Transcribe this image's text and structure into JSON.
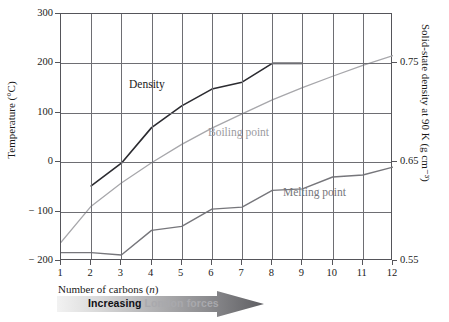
{
  "chart_data": {
    "type": "line",
    "title": "",
    "xlabel": "Number of carbons (n)",
    "ylabel": "Temperature (°C)",
    "y2label": "Solid-state density at 90 K (g cm⁻³)",
    "x": [
      1,
      2,
      3,
      4,
      5,
      6,
      7,
      8,
      9,
      10,
      11,
      12
    ],
    "xlim": [
      1,
      12
    ],
    "ylim": [
      -200,
      300
    ],
    "y2lim": [
      0.55,
      0.8
    ],
    "yticks": [
      -200,
      -100,
      0,
      100,
      200,
      300
    ],
    "ytick_labels": [
      "− 200",
      "− 100",
      "0",
      "100",
      "200",
      "300"
    ],
    "y2ticks": [
      0.55,
      0.65,
      0.75
    ],
    "y2tick_labels": [
      "0.55",
      "0.65",
      "0.75"
    ],
    "xticks": [
      1,
      2,
      3,
      4,
      5,
      6,
      7,
      8,
      9,
      10,
      11,
      12
    ],
    "xtick_labels": [
      "1",
      "2",
      "3",
      "4",
      "5",
      "6",
      "7",
      "8",
      "9",
      "10",
      "11",
      "12"
    ],
    "grid": true,
    "legend": "inline-labels",
    "series": [
      {
        "name": "Density",
        "axis": "right",
        "color": "#2b2b30",
        "x": [
          2,
          3,
          4,
          5,
          6,
          7,
          8,
          9
        ],
        "values": [
          0.626,
          0.649,
          0.685,
          0.707,
          0.724,
          0.731,
          0.75,
          0.75
        ]
      },
      {
        "name": "Boiling point",
        "axis": "left",
        "color": "#a7a7ab",
        "x": [
          1,
          2,
          3,
          4,
          5,
          6,
          7,
          8,
          9,
          10,
          11,
          12
        ],
        "values": [
          -162,
          -89,
          -42,
          -1,
          36,
          69,
          98,
          126,
          151,
          174,
          196,
          216
        ]
      },
      {
        "name": "Melting point",
        "axis": "left",
        "color": "#76767b",
        "x": [
          1,
          2,
          3,
          4,
          5,
          6,
          7,
          8,
          9,
          10,
          11,
          12
        ],
        "values": [
          -183,
          -183,
          -188,
          -138,
          -130,
          -95,
          -91,
          -57,
          -54,
          -30,
          -26,
          -10
        ]
      }
    ],
    "annotations": [
      {
        "name": "increasing-london-forces-arrow",
        "text_strong": "Increasing ",
        "text_faded": "London forces",
        "direction": "right"
      }
    ]
  },
  "series_labels": {
    "density": "Density",
    "boiling": "Boiling point",
    "melting": "Melting point"
  }
}
